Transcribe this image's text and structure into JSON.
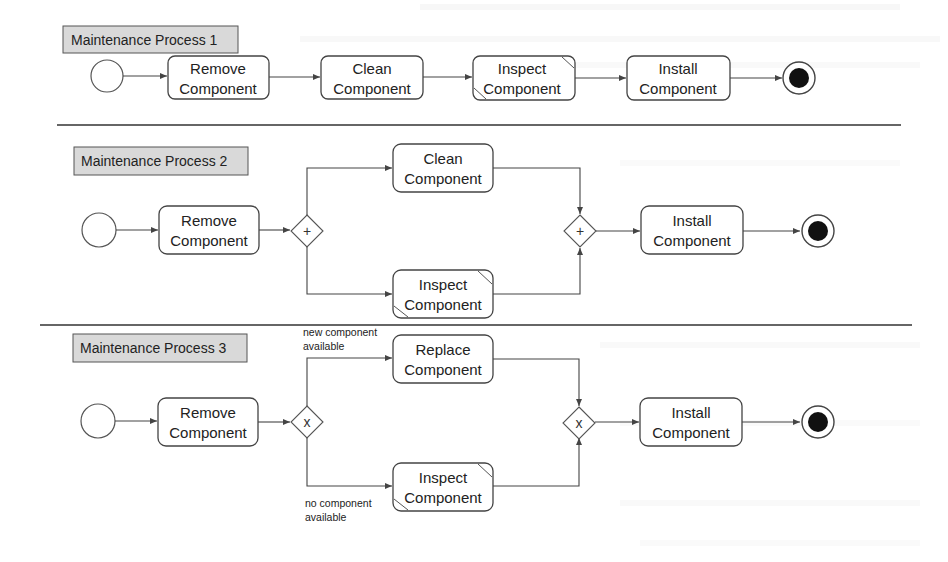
{
  "processes": [
    {
      "title": "Maintenance Process 1",
      "tasks": [
        {
          "line1": "Remove",
          "line2": "Component"
        },
        {
          "line1": "Clean",
          "line2": "Component"
        },
        {
          "line1": "Inspect",
          "line2": "Component"
        },
        {
          "line1": "Install",
          "line2": "Component"
        }
      ]
    },
    {
      "title": "Maintenance Process 2",
      "gateway_symbol": "+",
      "tasks": [
        {
          "line1": "Remove",
          "line2": "Component"
        },
        {
          "line1": "Clean",
          "line2": "Component"
        },
        {
          "line1": "Inspect",
          "line2": "Component"
        },
        {
          "line1": "Install",
          "line2": "Component"
        }
      ]
    },
    {
      "title": "Maintenance Process 3",
      "gateway_symbol": "x",
      "conditions": {
        "upper_line1": "new component",
        "upper_line2": "available",
        "lower_line1": "no component",
        "lower_line2": "available"
      },
      "tasks": [
        {
          "line1": "Remove",
          "line2": "Component"
        },
        {
          "line1": "Replace",
          "line2": "Component"
        },
        {
          "line1": "Inspect",
          "line2": "Component"
        },
        {
          "line1": "Install",
          "line2": "Component"
        }
      ]
    }
  ],
  "colors": {
    "title_fill": "#d9d9d9",
    "stroke": "#444444",
    "end_fill": "#111111"
  }
}
